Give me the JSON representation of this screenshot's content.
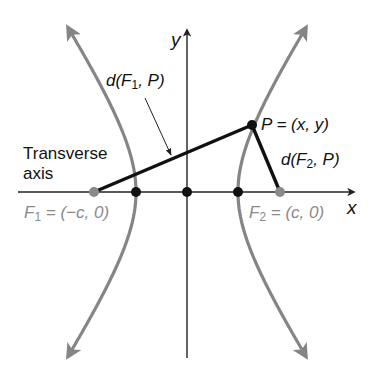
{
  "diagram": {
    "colors": {
      "curve": "#858585",
      "axes": "#222222",
      "segments": "#111111",
      "focus_points": "#8a8a8a",
      "vertex_points": "#111111",
      "focus_labels": "#8a8a8a",
      "text": "#111111"
    },
    "axes": {
      "x_label": "x",
      "y_label": "y"
    },
    "labels": {
      "transverse_axis_line1": "Transverse",
      "transverse_axis_line2": "axis",
      "d_f1_p": {
        "prefix": "d(F",
        "sub": "1",
        "suffix": ", P)"
      },
      "d_f2_p": {
        "prefix": "d(F",
        "sub": "2",
        "suffix": ", P)"
      },
      "point_p": "P = (x, y)",
      "focus1": {
        "prefix": "F",
        "sub": "1",
        "suffix": " = (−c, 0)"
      },
      "focus2": {
        "prefix": "F",
        "sub": "2",
        "suffix": " = (c, 0)"
      }
    },
    "points": [
      {
        "name": "F1",
        "coords": "(-c, 0)",
        "role": "focus"
      },
      {
        "name": "V1",
        "coords": "(-a, 0)",
        "role": "vertex"
      },
      {
        "name": "O",
        "coords": "(0, 0)",
        "role": "center"
      },
      {
        "name": "V2",
        "coords": "(a, 0)",
        "role": "vertex"
      },
      {
        "name": "F2",
        "coords": "(c, 0)",
        "role": "focus"
      },
      {
        "name": "P",
        "coords": "(x, y)",
        "role": "point on hyperbola"
      }
    ],
    "segments": [
      {
        "from": "F1",
        "to": "P",
        "label": "d(F1, P)"
      },
      {
        "from": "F2",
        "to": "P",
        "label": "d(F2, P)"
      }
    ]
  }
}
